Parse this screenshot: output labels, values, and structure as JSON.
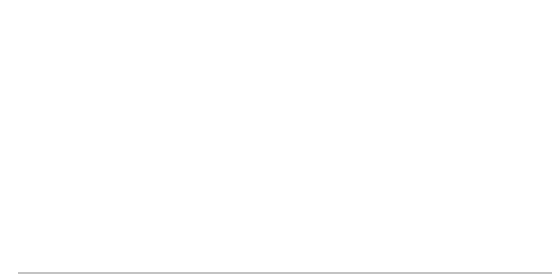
{
  "timeline": {
    "major_labels": [
      {
        "label": "0 years",
        "x": 43
      },
      {
        "label": "1 year",
        "x": 229
      },
      {
        "label": "2 years",
        "x": 415
      }
    ],
    "minor_labels": [
      {
        "num": "3",
        "unit": "mos.",
        "x": 89
      },
      {
        "num": "6",
        "unit": "mos.",
        "x": 136
      },
      {
        "num": "9",
        "unit": "mos.",
        "x": 183
      },
      {
        "num": "15",
        "unit": "mos.",
        "x": 275
      },
      {
        "num": "18",
        "unit": "mos.",
        "x": 322
      },
      {
        "num": "21",
        "unit": "mos.",
        "x": 369
      }
    ]
  },
  "rows": [
    {
      "deposit": "$500",
      "start_x": 43,
      "y": 91,
      "future": "$500 (1.02)",
      "exponent": "8"
    },
    {
      "deposit": "$500",
      "start_x": 96,
      "y": 113,
      "future": "$500 (1.02)",
      "exponent": "7"
    },
    {
      "deposit": "$500",
      "start_x": 141,
      "y": 137,
      "future": "$500 (1.02)",
      "exponent": "6"
    },
    {
      "deposit": "$500",
      "start_x": 189,
      "y": 160,
      "future": "$500 (1.02)",
      "exponent": "5"
    },
    {
      "deposit": "$500",
      "start_x": 233,
      "y": 183,
      "future": "$500 (1.02)",
      "exponent": "4"
    },
    {
      "deposit": "$500",
      "start_x": 278,
      "y": 205,
      "future": "$500 (1.02)",
      "exponent": "3"
    },
    {
      "deposit": "$500",
      "start_x": 330,
      "y": 228,
      "future": "$500 (1.02)",
      "exponent": "2"
    },
    {
      "deposit": "$500",
      "start_x": 373,
      "y": 250,
      "future": "$500 (1.02)",
      "exponent": ""
    }
  ],
  "brace_label": [
    "Future",
    "value"
  ]
}
